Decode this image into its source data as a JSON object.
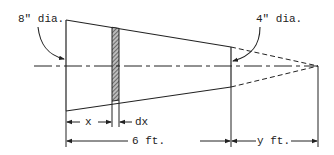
{
  "figure": {
    "type": "truncated cone (frustum) engineering sketch",
    "colors": {
      "line": "#222222",
      "background": "#ffffff"
    },
    "labels": {
      "large_end": "8\" dia.",
      "small_end": "4\" dia.",
      "element_position": "x",
      "element_width": "dx",
      "length": "6 ft.",
      "extension": "y ft."
    }
  }
}
